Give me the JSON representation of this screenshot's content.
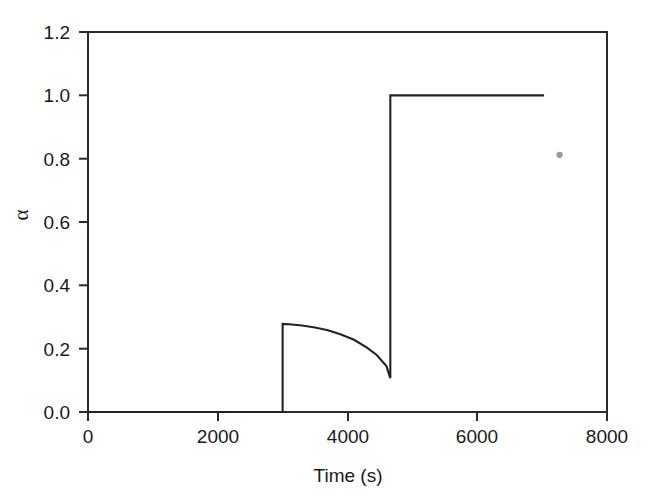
{
  "chart_data": {
    "type": "line",
    "title": "",
    "xlabel": "Time (s)",
    "ylabel": "α",
    "xlim": [
      0,
      8000
    ],
    "ylim": [
      0.0,
      1.2
    ],
    "xticks": [
      0,
      2000,
      4000,
      6000,
      8000
    ],
    "xtick_labels": [
      "0",
      "2000",
      "4000",
      "6000",
      "8000"
    ],
    "yticks": [
      0.0,
      0.2,
      0.4,
      0.6,
      0.8,
      1.0,
      1.2
    ],
    "ytick_labels": [
      "0.0",
      "0.2",
      "0.4",
      "0.6",
      "0.8",
      "1.0",
      "1.2"
    ],
    "grid": false,
    "legend": null,
    "line_color": "#232323",
    "series": [
      {
        "name": "alpha",
        "x": [
          0,
          3000,
          3000,
          3100,
          3300,
          3500,
          3700,
          3900,
          4100,
          4300,
          4450,
          4600,
          4660,
          4660,
          7030
        ],
        "y": [
          0.0,
          0.0,
          0.278,
          0.277,
          0.273,
          0.267,
          0.258,
          0.245,
          0.228,
          0.203,
          0.18,
          0.145,
          0.107,
          1.0,
          1.0
        ]
      }
    ],
    "annotations": [
      {
        "name": "speck",
        "x": 7270,
        "y": 0.812,
        "kind": "gray-dot"
      }
    ],
    "description_points": {
      "baseline_value": 0.0,
      "baseline_end_time": 3000,
      "first_jump_time": 3000,
      "first_peak_value": 0.278,
      "decay_min_value": 0.107,
      "second_jump_time": 4660,
      "plateau_value": 1.0,
      "plateau_end_time": 7030
    }
  },
  "figure": {
    "background_color": "#ffffff",
    "axis_color": "#2b2b2b"
  }
}
